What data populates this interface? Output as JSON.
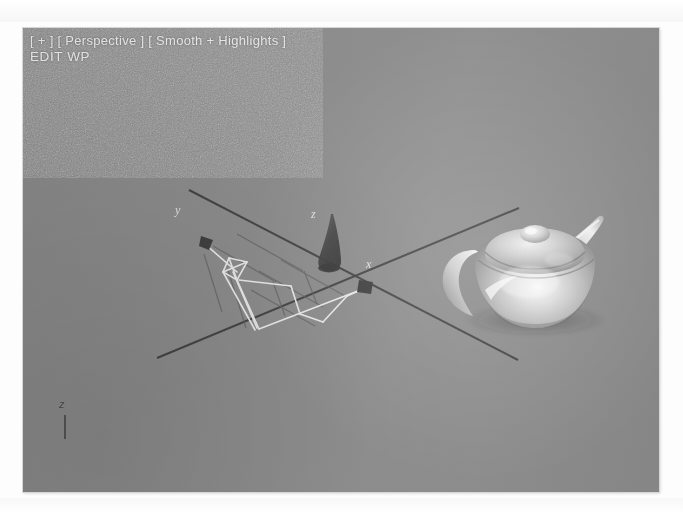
{
  "app": {
    "name": "3D modeling viewport",
    "viewport_background": "#8b8b8b"
  },
  "viewport": {
    "label_line1": "[ + ] [ Perspective ] [ Smooth + Highlights ]",
    "label_line2": "EDIT WP",
    "label_color": "#e8e8e8",
    "view_type": "Perspective",
    "shading_mode": "Smooth + Highlights",
    "view_menu_icon": "+"
  },
  "axes": {
    "x_label": "x",
    "y_label": "y",
    "z_label": "z",
    "origin_marker": "pivot-point",
    "line_color": "#3a3a3a"
  },
  "tripod": {
    "z_label": "z",
    "color": "#4a4a4a"
  },
  "objects": {
    "teapot": {
      "name": "Teapot",
      "shading": "smooth-highlights",
      "color": "#b9b9b9",
      "parts": [
        "body",
        "lid",
        "knob",
        "spout",
        "handle"
      ]
    },
    "selection": {
      "name": "Target Camera",
      "wireframe_color": "#f2f2f2",
      "selected": true
    },
    "cone": {
      "name": "Cone gizmo",
      "color": "#3f3f3f"
    },
    "grid": {
      "name": "Construction grid",
      "color": "#5a5a5a"
    }
  }
}
